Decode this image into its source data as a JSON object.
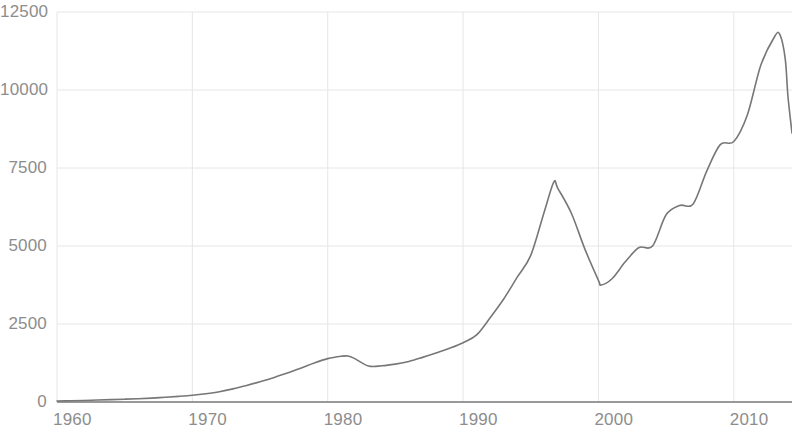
{
  "chart_data": {
    "type": "line",
    "title": "",
    "subtitle": "",
    "xlabel": "",
    "ylabel": "",
    "xlim": [
      1960,
      2014.3
    ],
    "ylim": [
      0,
      12500
    ],
    "grid": true,
    "legend": false,
    "x_ticks": [
      1960,
      1970,
      1980,
      1990,
      2000,
      2010
    ],
    "x_tick_labels": [
      "1960",
      "1970",
      "1980",
      "1990",
      "2000",
      "2010"
    ],
    "y_ticks": [
      0,
      2500,
      5000,
      7500,
      10000,
      12500
    ],
    "y_tick_labels": [
      "0",
      "2500",
      "5000",
      "7500",
      "10000",
      "12500"
    ],
    "line_color": "#777777",
    "grid_color": "#e6e6e6",
    "tick_color": "#8d8d8d",
    "background_color": "#ffffff",
    "series": [
      {
        "name": "value",
        "x": [
          1960,
          1961,
          1962,
          1963,
          1964,
          1965,
          1966,
          1967,
          1968,
          1969,
          1970,
          1971,
          1972,
          1973,
          1974,
          1975,
          1976,
          1977,
          1978,
          1979,
          1980,
          1981,
          1981.5,
          1982,
          1983,
          1984,
          1985,
          1986,
          1987,
          1988,
          1989,
          1990,
          1991,
          1992,
          1993,
          1994,
          1995,
          1996,
          1996.7,
          1997,
          1998,
          1999,
          2000,
          2000.2,
          2001,
          2002,
          2003,
          2004,
          2005,
          2006,
          2007,
          2008,
          2009,
          2010,
          2011,
          2012,
          2013,
          2013.4,
          2013.8,
          2014,
          2014.3
        ],
        "y": [
          30,
          40,
          50,
          62,
          75,
          90,
          105,
          125,
          150,
          180,
          215,
          265,
          330,
          420,
          530,
          650,
          780,
          930,
          1080,
          1250,
          1390,
          1465,
          1475,
          1390,
          1155,
          1160,
          1215,
          1300,
          1430,
          1570,
          1720,
          1900,
          2150,
          2700,
          3300,
          4000,
          4700,
          6100,
          7050,
          6850,
          6050,
          4900,
          3900,
          3750,
          3950,
          4500,
          4950,
          5000,
          6000,
          6300,
          6350,
          7400,
          8250,
          8350,
          9200,
          10800,
          11700,
          11780,
          11000,
          9800,
          8620
        ],
        "style": "solid",
        "width": 1.6
      }
    ],
    "notes": {
      "local_peak_1981": 1475,
      "local_trough_1983": 1155,
      "peak_1997": 7050,
      "trough_2000": 3750,
      "plateau_2005_2007": 6350,
      "max_value_2013": 11780,
      "final_value_2014": 8620
    }
  },
  "axes_geometry": {
    "plot_left_px": 57,
    "plot_right_px": 792,
    "plot_top_px": 12,
    "plot_bottom_px": 402,
    "px_per_decade": 127.4,
    "px_per_2500": 78
  }
}
